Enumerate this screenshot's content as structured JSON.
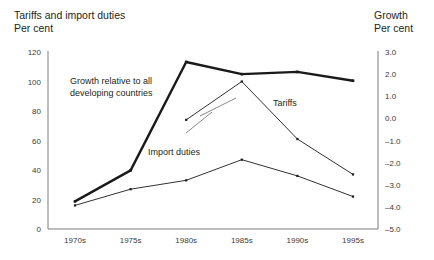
{
  "left_axis": {
    "title_line1": "Tariffs and import duties",
    "title_line2": "Per cent",
    "ticks": [
      "0",
      "20",
      "40",
      "60",
      "80",
      "100",
      "120"
    ],
    "min": 0,
    "max": 120
  },
  "right_axis": {
    "title_line1": "Growth",
    "title_line2": "Per cent",
    "ticks": [
      "3.0",
      "2.0",
      "1.0",
      "0.0",
      "–1.0",
      "–2.0",
      "–3.0",
      "–4.0",
      "–5.0"
    ],
    "min": -5.0,
    "max": 3.0
  },
  "annotations": {
    "growth_line1": "Growth relative to all",
    "growth_line2": "developing countries",
    "tariffs": "Tariffs",
    "import_duties": "Import duties"
  },
  "chart_data": {
    "type": "line",
    "title": "Tariffs and import duties",
    "xlabel": "",
    "ylabel": "Per cent",
    "y2label": "Per cent",
    "ylim": [
      0,
      120
    ],
    "y2lim": [
      -5.0,
      3.0
    ],
    "grid": false,
    "legend": "annotations-inline",
    "categories": [
      "1970s",
      "1975s",
      "1980s",
      "1985s",
      "1990s",
      "1995s"
    ],
    "series": [
      {
        "name": "Growth relative to all developing countries",
        "axis": "right",
        "style": "thick",
        "x": [
          "1970s",
          "1975s",
          "1980s",
          "1985s",
          "1990s",
          "1995s"
        ],
        "values": [
          -3.75,
          -2.35,
          2.55,
          2.0,
          2.1,
          1.7
        ]
      },
      {
        "name": "Tariffs",
        "axis": "left",
        "style": "thin",
        "x": [
          "1980s",
          "1985s",
          "1990s",
          "1995s"
        ],
        "values": [
          74,
          100,
          61,
          37
        ]
      },
      {
        "name": "Import duties",
        "axis": "left",
        "style": "thin",
        "x": [
          "1970s",
          "1975s",
          "1980s",
          "1985s",
          "1990s",
          "1995s"
        ],
        "values": [
          16,
          27,
          33,
          47,
          36,
          22
        ]
      }
    ]
  },
  "geometry": {
    "plot_left": 48,
    "plot_right": 378,
    "plot_top": 52,
    "plot_bottom": 229,
    "cat_step_first": 75,
    "cat_step_last": 353
  }
}
